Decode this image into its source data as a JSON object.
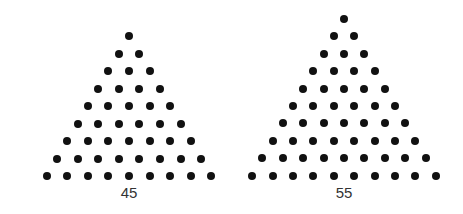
{
  "colors": {
    "dot": "#111111",
    "label": "#333333",
    "background": "#ffffff"
  },
  "triangles": [
    {
      "label": "45",
      "rows": 9,
      "apex": [
        129,
        36
      ],
      "dx": 20.6,
      "dy": 17.5
    },
    {
      "label": "55",
      "rows": 10,
      "apex": [
        344,
        19
      ],
      "dx": 20.4,
      "dy": 17.4
    }
  ]
}
